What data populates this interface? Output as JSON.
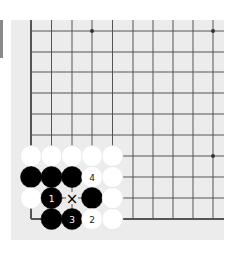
{
  "diagram": {
    "type": "go-board",
    "view": "lower-left corner",
    "colors": {
      "board": "#ececec",
      "line": "#555555",
      "black_stone": "#000000",
      "white_stone": "#ffffff",
      "side_bar": "#8a8a8a"
    },
    "grid": {
      "columns_x": [
        31,
        51.5,
        72,
        92,
        112.5,
        133,
        153,
        173,
        193,
        213
      ],
      "rows_y": [
        31,
        52,
        72,
        93,
        114,
        135,
        156,
        177,
        198,
        219
      ],
      "left_edge": true,
      "bottom_edge": true
    },
    "star_points": [
      [
        3,
        0
      ],
      [
        9,
        0
      ],
      [
        9,
        6
      ],
      [
        3,
        6
      ]
    ],
    "stones": [
      {
        "col": 0,
        "row": 6,
        "color": "white",
        "label": ""
      },
      {
        "col": 1,
        "row": 6,
        "color": "white",
        "label": ""
      },
      {
        "col": 2,
        "row": 6,
        "color": "white",
        "label": ""
      },
      {
        "col": 3,
        "row": 6,
        "color": "white",
        "label": ""
      },
      {
        "col": 4,
        "row": 6,
        "color": "white",
        "label": ""
      },
      {
        "col": 0,
        "row": 7,
        "color": "black",
        "label": ""
      },
      {
        "col": 1,
        "row": 7,
        "color": "black",
        "label": ""
      },
      {
        "col": 2,
        "row": 7,
        "color": "black",
        "label": ""
      },
      {
        "col": 3,
        "row": 7,
        "color": "white",
        "label": "4"
      },
      {
        "col": 4,
        "row": 7,
        "color": "white",
        "label": ""
      },
      {
        "col": 0,
        "row": 8,
        "color": "white",
        "label": ""
      },
      {
        "col": 1,
        "row": 8,
        "color": "black",
        "label": "1"
      },
      {
        "col": 3,
        "row": 8,
        "color": "black",
        "label": ""
      },
      {
        "col": 4,
        "row": 8,
        "color": "white",
        "label": ""
      },
      {
        "col": 1,
        "row": 9,
        "color": "black",
        "label": ""
      },
      {
        "col": 2,
        "row": 9,
        "color": "black",
        "label": "3"
      },
      {
        "col": 3,
        "row": 9,
        "color": "white",
        "label": "2"
      },
      {
        "col": 4,
        "row": 9,
        "color": "white",
        "label": ""
      }
    ],
    "markers": [
      {
        "col": 2,
        "row": 8,
        "symbol": "×"
      }
    ]
  }
}
